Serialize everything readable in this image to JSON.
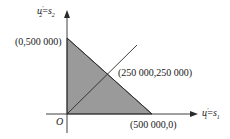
{
  "diagram": {
    "type": "feasible-region",
    "axes": {
      "x": {
        "var": "u",
        "sup": "′",
        "sub1": "1",
        "eq": "=",
        "var2": "s",
        "sub2": "1"
      },
      "y": {
        "var": "u",
        "sup": "′",
        "sub1": "2",
        "eq": "=",
        "var2": "s",
        "sub2": "2"
      },
      "origin": "O"
    },
    "points": {
      "y_intercept": "(0,500 000)",
      "midpoint": "(250 000,250 000)",
      "x_intercept": "(500 000,0)"
    },
    "colors": {
      "shaded_region": "#9a9a9a",
      "lines": "#2a2a2a",
      "background": "#ffffff"
    }
  }
}
